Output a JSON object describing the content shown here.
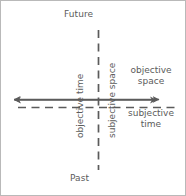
{
  "figure": {
    "width": 186,
    "height": 196,
    "background_color": "#ffffff",
    "line_color": "#5b5b5b",
    "text_color": "#5b5b5b",
    "border_color": "#b9b9b9"
  },
  "labels": {
    "future": "Future",
    "past": "Past",
    "objective_time": "objective time",
    "subjective_space": "subjective space",
    "objective_space_line1": "objective",
    "objective_space_line2": "space",
    "subjective_time_line1": "subjective",
    "subjective_time_line2": "time"
  },
  "axes": [
    {
      "name": "objective-time-axis",
      "style": "solid",
      "orientation": "vertical",
      "label": "objective time",
      "positive_end_label": "Future",
      "negative_end_label": "Past",
      "arrowheads": "both"
    },
    {
      "name": "objective-space-axis",
      "style": "solid",
      "orientation": "horizontal",
      "label": "objective space",
      "arrowheads": "both"
    },
    {
      "name": "subjective-space-axis",
      "style": "dashed",
      "orientation": "vertical",
      "label": "subjective space",
      "arrowheads": "none"
    },
    {
      "name": "subjective-time-axis",
      "style": "dashed",
      "orientation": "horizontal",
      "label": "subjective time",
      "arrowheads": "none"
    }
  ]
}
